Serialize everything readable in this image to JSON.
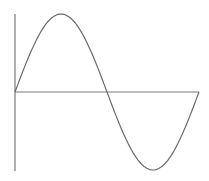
{
  "chart_data": {
    "type": "line",
    "title": "",
    "xlabel": "",
    "ylabel": "",
    "grid": false,
    "legend": null,
    "series": [
      {
        "name": "sine",
        "function": "sin(x)",
        "x": [
          0,
          0.7854,
          1.5708,
          2.3562,
          3.1416,
          3.927,
          4.7124,
          5.4978,
          6.2832
        ],
        "values": [
          0,
          0.7071,
          1,
          0.7071,
          0,
          -0.7071,
          -1,
          -0.7071,
          0
        ]
      }
    ],
    "xlim": [
      0,
      6.2832
    ],
    "ylim": [
      -1,
      1
    ]
  },
  "style": {
    "stroke_color": "#6b6b6b",
    "axis_color": "#7a7a7a",
    "background": "#ffffff"
  },
  "layout": {
    "origin_x": 15,
    "origin_y": 92,
    "plot_width": 184,
    "amplitude_px": 78,
    "v_axis_top": 14,
    "v_axis_bottom": 171
  }
}
